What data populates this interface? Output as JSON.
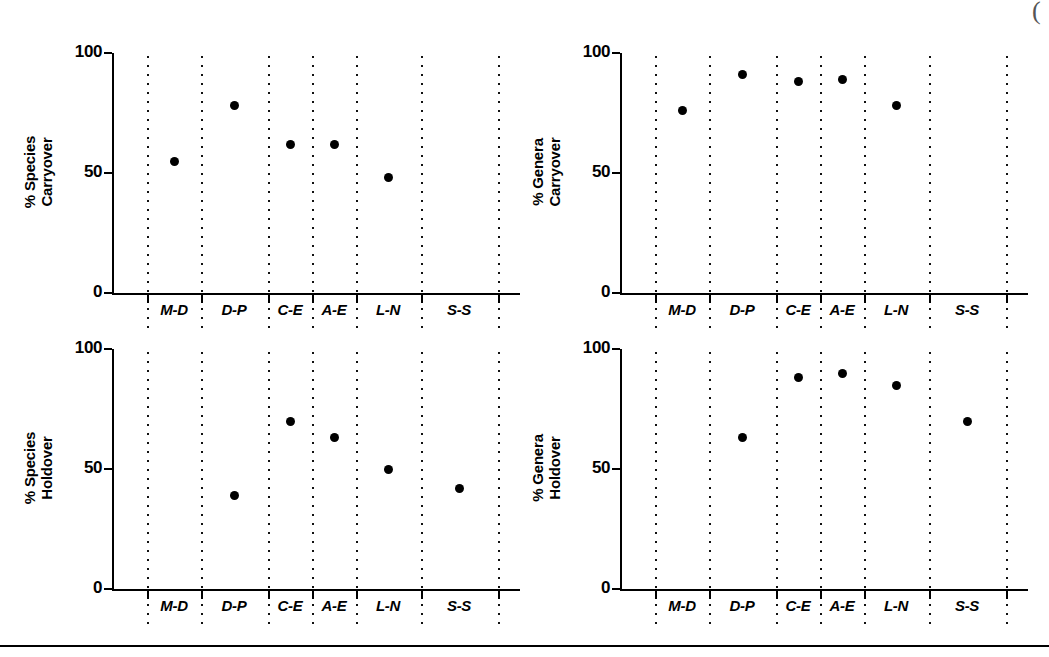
{
  "chart_data": [
    {
      "type": "scatter",
      "title": "",
      "ylabel": "% Species Carryover",
      "ylabel_line1": "% Species",
      "ylabel_line2": "Carryover",
      "xlabel": "",
      "ylim": [
        0,
        100
      ],
      "yticks": [
        0,
        50,
        100
      ],
      "ytick_labels": [
        "0",
        "50",
        "100"
      ],
      "grid": "dotted-vertical-separators",
      "legend": "none",
      "categories": [
        "M-D",
        "D-P",
        "C-E",
        "A-E",
        "L-N",
        "S-S"
      ],
      "values": [
        55,
        78,
        62,
        62,
        48,
        null
      ]
    },
    {
      "type": "scatter",
      "title": "",
      "ylabel": "% Genera Carryover",
      "ylabel_line1": "% Genera",
      "ylabel_line2": "Carryover",
      "xlabel": "",
      "ylim": [
        0,
        100
      ],
      "yticks": [
        0,
        50,
        100
      ],
      "ytick_labels": [
        "0",
        "50",
        "100"
      ],
      "grid": "dotted-vertical-separators",
      "legend": "none",
      "categories": [
        "M-D",
        "D-P",
        "C-E",
        "A-E",
        "L-N",
        "S-S"
      ],
      "values": [
        76,
        91,
        88,
        89,
        78,
        null
      ]
    },
    {
      "type": "scatter",
      "title": "",
      "ylabel": "% Species Holdover",
      "ylabel_line1": "% Species",
      "ylabel_line2": "Holdover",
      "xlabel": "",
      "ylim": [
        0,
        100
      ],
      "yticks": [
        0,
        50,
        100
      ],
      "ytick_labels": [
        "0",
        "50",
        "100"
      ],
      "grid": "dotted-vertical-separators",
      "legend": "none",
      "categories": [
        "M-D",
        "D-P",
        "C-E",
        "A-E",
        "L-N",
        "S-S"
      ],
      "values": [
        null,
        39,
        70,
        63,
        50,
        42
      ]
    },
    {
      "type": "scatter",
      "title": "",
      "ylabel": "% Genera Holdover",
      "ylabel_line1": "% Genera",
      "ylabel_line2": "Holdover",
      "xlabel": "",
      "ylim": [
        0,
        100
      ],
      "yticks": [
        0,
        50,
        100
      ],
      "ytick_labels": [
        "0",
        "50",
        "100"
      ],
      "grid": "dotted-vertical-separators",
      "legend": "none",
      "categories": [
        "M-D",
        "D-P",
        "C-E",
        "A-E",
        "L-N",
        "S-S"
      ],
      "values": [
        null,
        63,
        88,
        90,
        85,
        70
      ]
    }
  ],
  "panels": [
    {
      "id": "species-carryover",
      "ylabel_line1": "% Species",
      "ylabel_line2": "Carryover"
    },
    {
      "id": "genera-carryover",
      "ylabel_line1": "% Genera",
      "ylabel_line2": "Carryover"
    },
    {
      "id": "species-holdover",
      "ylabel_line1": "% Species",
      "ylabel_line2": "Holdover"
    },
    {
      "id": "genera-holdover",
      "ylabel_line1": "% Genera",
      "ylabel_line2": "Holdover"
    }
  ],
  "axis": {
    "ytick_labels": [
      "100",
      "50",
      "0"
    ],
    "categories": [
      "M-D",
      "D-P",
      "C-E",
      "A-E",
      "L-N",
      "S-S"
    ]
  },
  "page": {
    "corner_mark": "("
  },
  "colors": {
    "point": "#000000",
    "axis": "#000000",
    "separator": "#111111",
    "background": "#ffffff"
  }
}
